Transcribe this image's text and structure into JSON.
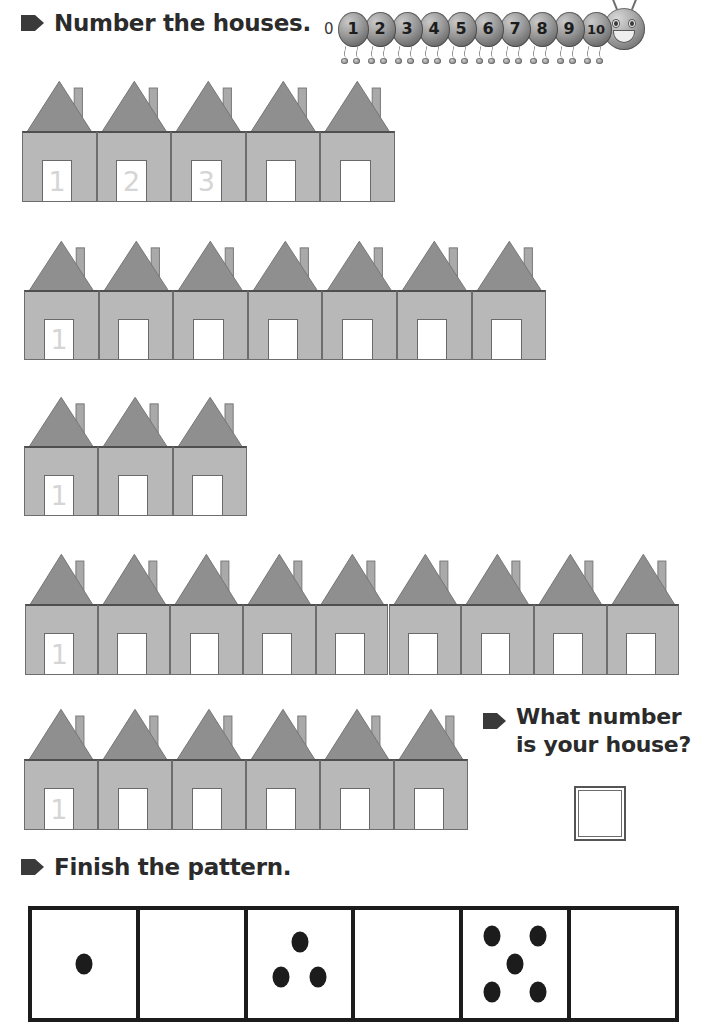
{
  "worksheet": {
    "headings": {
      "number_the_houses": "Number the houses.",
      "what_number_line1": "What number",
      "what_number_line2": "is your house?",
      "finish_the_pattern": "Finish the pattern."
    },
    "colors": {
      "roof": "#8f8f8f",
      "roof_dark": "#7d7d7d",
      "body": "#b8b8b8",
      "door": "#ffffff",
      "outline": "#6d6d6d",
      "ghost_number": "#d5d5d5",
      "dot": "#1c1c1c",
      "text": "#2b2b2b"
    },
    "number_line": {
      "start_label": "0",
      "segments": [
        "1",
        "2",
        "3",
        "4",
        "5",
        "6",
        "7",
        "8",
        "9",
        "10"
      ],
      "head_icon": "smiley-caterpillar-head-icon",
      "bullet_icon": "arrow-bullet-icon"
    },
    "house_rows": [
      {
        "id": "row-1",
        "count": 5,
        "left": 22,
        "top": 78,
        "house_width": 74.6,
        "height": 124,
        "door_numbers": [
          "1",
          "2",
          "3",
          "",
          ""
        ]
      },
      {
        "id": "row-2",
        "count": 7,
        "left": 24,
        "top": 238,
        "house_width": 74.6,
        "height": 122,
        "door_numbers": [
          "1",
          "",
          "",
          "",
          "",
          "",
          ""
        ]
      },
      {
        "id": "row-3",
        "count": 3,
        "left": 24,
        "top": 394,
        "house_width": 74.3,
        "height": 122,
        "door_numbers": [
          "1",
          "",
          ""
        ]
      },
      {
        "id": "row-4",
        "count": 9,
        "left": 25,
        "top": 551,
        "house_width": 72.7,
        "height": 124,
        "door_numbers": [
          "1",
          "",
          "",
          "",
          "",
          "",
          "",
          "",
          ""
        ]
      },
      {
        "id": "row-5",
        "count": 6,
        "left": 24,
        "top": 706,
        "house_width": 74.0,
        "height": 124,
        "door_numbers": [
          "1",
          "",
          "",
          "",
          "",
          ""
        ]
      }
    ],
    "answer_box": {
      "label": "house-number-answer-box",
      "value": ""
    },
    "pattern": {
      "cells": [
        {
          "dot_count": 1,
          "dots": [
            [
              50,
              50
            ]
          ]
        },
        {
          "dot_count": 0,
          "dots": []
        },
        {
          "dot_count": 3,
          "dots": [
            [
              50,
              30
            ],
            [
              32,
              62
            ],
            [
              68,
              62
            ]
          ]
        },
        {
          "dot_count": 0,
          "dots": []
        },
        {
          "dot_count": 5,
          "dots": [
            [
              28,
              24
            ],
            [
              72,
              24
            ],
            [
              50,
              50
            ],
            [
              28,
              76
            ],
            [
              72,
              76
            ]
          ]
        },
        {
          "dot_count": 0,
          "dots": []
        }
      ]
    }
  }
}
